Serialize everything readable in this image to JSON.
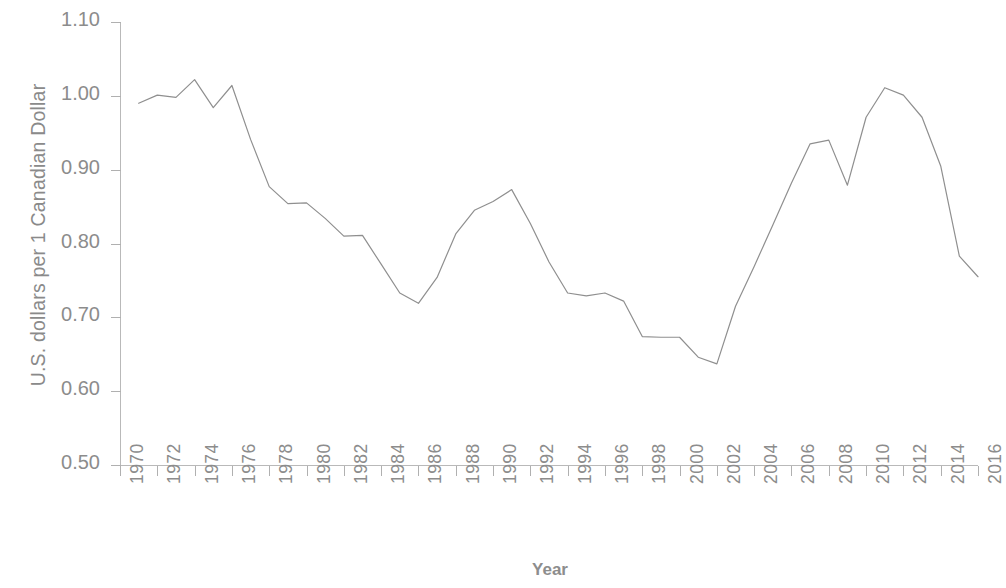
{
  "chart_data": {
    "type": "line",
    "title": "",
    "xlabel": "Year",
    "ylabel": "U.S. dollars per 1 Canadian Dollar",
    "xlim": [
      1970,
      2016
    ],
    "ylim": [
      0.5,
      1.1
    ],
    "grid": false,
    "legend": false,
    "line_color": "#8f8f8f",
    "x_tick_labels": [
      "1970",
      "1972",
      "1974",
      "1976",
      "1978",
      "1980",
      "1982",
      "1984",
      "1986",
      "1988",
      "1990",
      "1992",
      "1994",
      "1996",
      "1998",
      "2000",
      "2002",
      "2004",
      "2006",
      "2008",
      "2010",
      "2012",
      "2014",
      "2016"
    ],
    "y_tick_labels": [
      "0.50",
      "0.60",
      "0.70",
      "0.80",
      "0.90",
      "1.00",
      "1.10"
    ],
    "y_tick_values": [
      0.5,
      0.6,
      0.7,
      0.8,
      0.9,
      1.0,
      1.1
    ],
    "x": [
      1971,
      1972,
      1973,
      1974,
      1975,
      1976,
      1977,
      1978,
      1979,
      1980,
      1981,
      1982,
      1983,
      1984,
      1985,
      1986,
      1987,
      1988,
      1989,
      1990,
      1991,
      1992,
      1993,
      1994,
      1995,
      1996,
      1997,
      1998,
      1999,
      2000,
      2001,
      2002,
      2003,
      2004,
      2005,
      2006,
      2007,
      2008,
      2009,
      2010,
      2011,
      2012,
      2013,
      2014,
      2015,
      2016
    ],
    "values": [
      0.99,
      1.001,
      0.998,
      1.022,
      0.984,
      1.014,
      0.941,
      0.877,
      0.854,
      0.855,
      0.834,
      0.81,
      0.811,
      0.772,
      0.733,
      0.719,
      0.754,
      0.813,
      0.845,
      0.857,
      0.873,
      0.827,
      0.775,
      0.733,
      0.729,
      0.733,
      0.722,
      0.674,
      0.673,
      0.673,
      0.646,
      0.637,
      0.715,
      0.769,
      0.825,
      0.882,
      0.935,
      0.94,
      0.879,
      0.971,
      1.011,
      1.001,
      0.971,
      0.905,
      0.783,
      0.755
    ]
  }
}
